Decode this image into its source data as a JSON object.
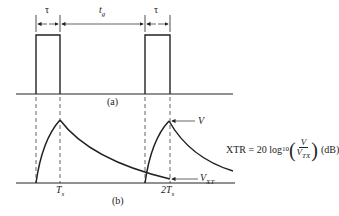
{
  "figure": {
    "panel_a": {
      "label": "(a)",
      "pulse_width_label": "τ",
      "gap_label_main": "t",
      "gap_label_sub": "g",
      "pulse2_width_label": "τ"
    },
    "panel_b": {
      "label": "(b)",
      "tick1_main": "T",
      "tick1_sub": "s",
      "tick2_main": "2T",
      "tick2_sub": "s",
      "peak_label": "V",
      "crosstalk_label_main": "V",
      "crosstalk_label_sub": "XT"
    },
    "formula": {
      "lhs": "XTR = 20 log",
      "log_base": "10",
      "numerator": "V",
      "denominator_main": "V",
      "denominator_sub": "TX",
      "unit": "(dB)"
    },
    "colors": {
      "line": "#222222",
      "background": "#ffffff"
    }
  }
}
